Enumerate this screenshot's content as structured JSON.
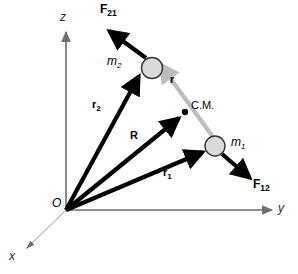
{
  "figure": {
    "width": 298,
    "height": 274,
    "background": "#ffffff"
  },
  "colors": {
    "vector_black": "#000000",
    "axis_gray": "#6e6e6e",
    "separation_gray": "#bdbdbd",
    "mass_fill": "#d9d9d9",
    "mass_stroke": "#333333",
    "text": "#000000"
  },
  "axes": [
    {
      "id": "z-axis",
      "label": "z",
      "label_x": 61,
      "label_y": 16,
      "from": [
        66,
        210
      ],
      "to": [
        66,
        32
      ],
      "style": "solid",
      "color": "#6e6e6e"
    },
    {
      "id": "y-axis",
      "label": "y",
      "label_x": 278,
      "label_y": 203,
      "from": [
        66,
        210
      ],
      "to": [
        272,
        210
      ],
      "style": "solid",
      "color": "#6e6e6e"
    },
    {
      "id": "x-axis",
      "label": "x",
      "label_x": 9,
      "label_y": 251,
      "from": [
        66,
        210
      ],
      "to": [
        26,
        249
      ],
      "style": "thin",
      "color": "#6e6e6e"
    }
  ],
  "origin": {
    "label": "O",
    "x": 66,
    "y": 210,
    "label_x": 53,
    "label_y": 198
  },
  "masses": [
    {
      "id": "m1",
      "label": "m",
      "subscript": "1",
      "cx": 215,
      "cy": 146,
      "r": 10,
      "label_x": 231,
      "label_y": 138
    },
    {
      "id": "m2",
      "label": "m",
      "subscript": "2",
      "cx": 152,
      "cy": 68,
      "r": 11,
      "label_x": 108,
      "label_y": 56
    }
  ],
  "center_of_mass": {
    "label": "C.M.",
    "x": 185,
    "y": 112,
    "dot_r": 3,
    "label_x": 191,
    "label_y": 100
  },
  "vectors": [
    {
      "id": "r2",
      "label": "r",
      "subscript": "2",
      "from": [
        66,
        210
      ],
      "to": [
        141,
        73
      ],
      "color": "#000000",
      "width": 4,
      "label_x": 93,
      "label_y": 100
    },
    {
      "id": "R",
      "label": "R",
      "subscript": "",
      "from": [
        66,
        210
      ],
      "to": [
        182,
        116
      ],
      "color": "#000000",
      "width": 4,
      "label_x": 130,
      "label_y": 131
    },
    {
      "id": "r1",
      "label": "r",
      "subscript": "1",
      "from": [
        66,
        210
      ],
      "to": [
        206,
        151
      ],
      "color": "#000000",
      "width": 4,
      "label_x": 163,
      "label_y": 168
    },
    {
      "id": "r-separation",
      "label": "r",
      "subscript": "",
      "from": [
        213,
        137
      ],
      "to": [
        158,
        62
      ],
      "color": "#bdbdbd",
      "width": 4,
      "label_x": 170,
      "label_y": 74
    }
  ],
  "forces": [
    {
      "id": "F21",
      "label": "F",
      "subscript": "21",
      "from": [
        145,
        57
      ],
      "to": [
        107,
        29
      ],
      "color": "#000000",
      "width": 4,
      "label_x": 101,
      "label_y": 3
    },
    {
      "id": "F12",
      "label": "F",
      "subscript": "12",
      "from": [
        222,
        154
      ],
      "to": [
        252,
        180
      ],
      "color": "#000000",
      "width": 4,
      "label_x": 253,
      "label_y": 180
    }
  ]
}
